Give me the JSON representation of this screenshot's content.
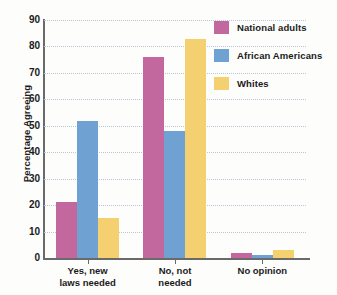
{
  "chart_data": {
    "type": "bar",
    "title": "",
    "subtitle": "",
    "xlabel": "",
    "ylabel": "Percentage Agreeing",
    "categories": [
      "Yes, new laws needed",
      "No, not needed",
      "No opinion"
    ],
    "category_lines": [
      [
        "Yes, new",
        "laws needed"
      ],
      [
        "No, not",
        "needed"
      ],
      [
        "No opinion"
      ]
    ],
    "series": [
      {
        "name": "National adults",
        "color": "#c2689f",
        "values": [
          21,
          76,
          2
        ]
      },
      {
        "name": "African Americans",
        "color": "#6fa2d2",
        "values": [
          52,
          48,
          1
        ]
      },
      {
        "name": "Whites",
        "color": "#f4d071",
        "values": [
          15,
          83,
          3
        ]
      }
    ],
    "ylim": [
      0,
      90
    ],
    "ytick_step": 10,
    "ytick_labels": [
      "90",
      "80",
      "70",
      "60",
      "50",
      "40",
      "30",
      "20",
      "10",
      "0"
    ],
    "ytick_values": [
      90,
      80,
      70,
      60,
      50,
      40,
      30,
      20,
      10,
      0
    ],
    "grid": true,
    "grid_style": "dotted",
    "grid_color": "#b9c6d8",
    "legend_position": "top-right",
    "axis_color": "#6a6a6a",
    "background": "#fdfdfc"
  }
}
